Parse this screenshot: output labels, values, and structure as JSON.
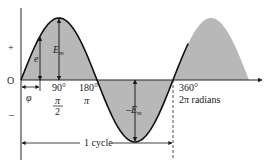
{
  "colors": {
    "curve": "#111111",
    "fill": "#b8b8b8",
    "axis": "#222222",
    "background": "#ffffff"
  },
  "axis_labels": {
    "plus": "+",
    "minus": "–",
    "origin": "O"
  },
  "angle_labels": {
    "deg90": "90°",
    "rad90_num": "π",
    "rad90_den": "2",
    "deg180": "180°",
    "rad180": "π",
    "deg360": "360°",
    "rad360": "2π radians"
  },
  "annotations": {
    "instantaneous": "e",
    "peak_pos_main": "E",
    "peak_pos_sub": "m",
    "peak_neg_main": "–E",
    "peak_neg_sub": "m",
    "phase": "φ",
    "cycle": "1 cycle"
  },
  "waveform": {
    "type": "sine",
    "cycles_shown": 1.1,
    "phase_offset_fraction_of_cycle": 0.0,
    "amplitude_label": "Em"
  }
}
